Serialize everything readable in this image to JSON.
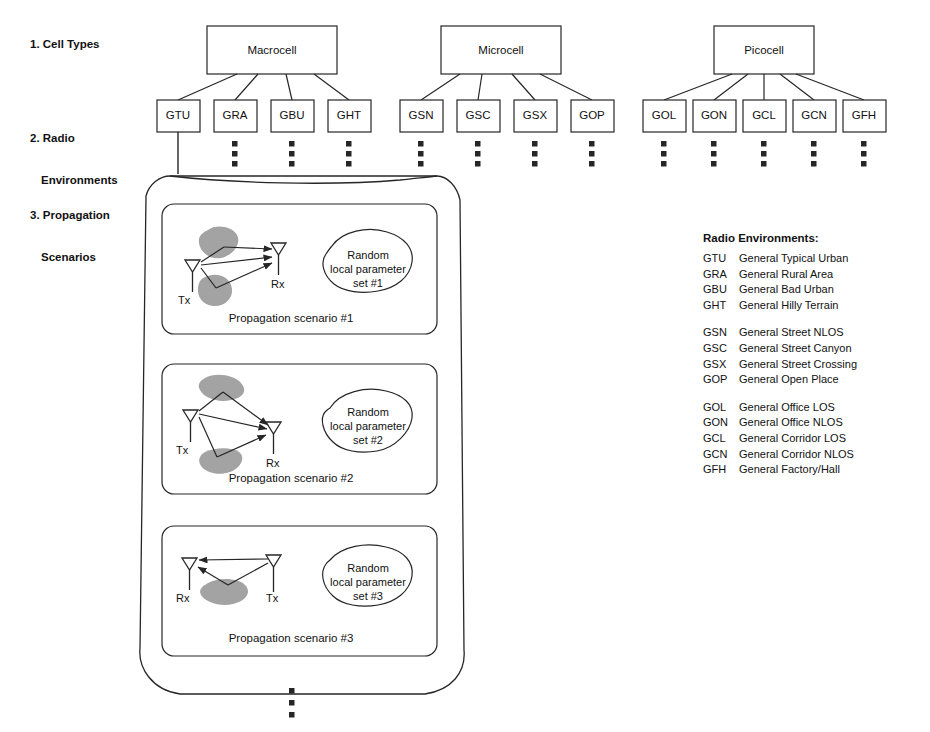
{
  "rows": {
    "r1": "1. Cell Types",
    "r2_line1": "2. Radio",
    "r2_line2": "Environments",
    "r3_line1": "3. Propagation",
    "r3_line2": "Scenarios"
  },
  "cell_types": [
    {
      "name": "Macrocell",
      "x": 272,
      "children": [
        "GTU",
        "GRA",
        "GBU",
        "GHT"
      ]
    },
    {
      "name": "Microcell",
      "x": 501,
      "children": [
        "GSN",
        "GSC",
        "GSX",
        "GOP"
      ]
    },
    {
      "name": "Picocell",
      "x": 764,
      "children": [
        "GOL",
        "GON",
        "GCL",
        "GCN",
        "GFH"
      ]
    }
  ],
  "radio_environment_boxes": [
    {
      "code": "GTU",
      "x": 178
    },
    {
      "code": "GRA",
      "x": 235
    },
    {
      "code": "GBU",
      "x": 292
    },
    {
      "code": "GHT",
      "x": 349
    },
    {
      "code": "GSN",
      "x": 421
    },
    {
      "code": "GSC",
      "x": 478
    },
    {
      "code": "GSX",
      "x": 535
    },
    {
      "code": "GOP",
      "x": 592
    },
    {
      "code": "GOL",
      "x": 664
    },
    {
      "code": "GON",
      "x": 714
    },
    {
      "code": "GCL",
      "x": 764
    },
    {
      "code": "GCN",
      "x": 814
    },
    {
      "code": "GFH",
      "x": 864
    }
  ],
  "scenarios": [
    {
      "caption": "Propagation scenario #1",
      "blob_lines": [
        "Random",
        "local parameter",
        "set #1"
      ],
      "tx_label": "Tx",
      "rx_label": "Rx"
    },
    {
      "caption": "Propagation scenario #2",
      "blob_lines": [
        "Random",
        "local parameter",
        "set #2"
      ],
      "tx_label": "Tx",
      "rx_label": "Rx"
    },
    {
      "caption": "Propagation scenario #3",
      "blob_lines": [
        "Random",
        "local parameter",
        "set #3"
      ],
      "tx_label": "Tx",
      "rx_label": "Rx"
    }
  ],
  "legend": {
    "title": "Radio Environments:",
    "groups": [
      [
        {
          "code": "GTU",
          "desc": "General Typical Urban"
        },
        {
          "code": "GRA",
          "desc": "General Rural Area"
        },
        {
          "code": "GBU",
          "desc": "General Bad Urban"
        },
        {
          "code": "GHT",
          "desc": "General Hilly Terrain"
        }
      ],
      [
        {
          "code": "GSN",
          "desc": "General Street NLOS"
        },
        {
          "code": "GSC",
          "desc": "General Street Canyon"
        },
        {
          "code": "GSX",
          "desc": "General Street Crossing"
        },
        {
          "code": "GOP",
          "desc": "General Open Place"
        }
      ],
      [
        {
          "code": "GOL",
          "desc": "General Office LOS"
        },
        {
          "code": "GON",
          "desc": "General Office NLOS"
        },
        {
          "code": "GCL",
          "desc": "General Corridor LOS"
        },
        {
          "code": "GCN",
          "desc": "General Corridor NLOS"
        },
        {
          "code": "GFH",
          "desc": "General Factory/Hall"
        }
      ]
    ]
  },
  "colors": {
    "stroke": "#262626",
    "blob_fill": "#a3a3a3",
    "background": "#ffffff"
  }
}
